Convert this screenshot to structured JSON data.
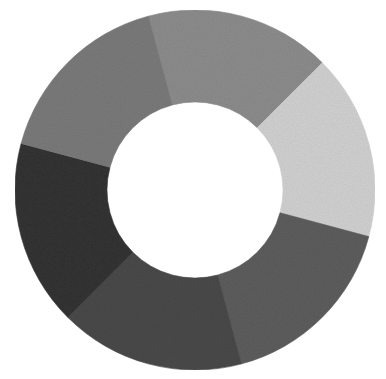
{
  "figure": {
    "center": [
      195,
      190
    ],
    "outer_radius": 180,
    "inner_radius": 88,
    "background": "#ffffff"
  },
  "segments": [
    {
      "name": "segment-top",
      "start_deg": -15,
      "end_deg": 45,
      "color": "#8e8e8e"
    },
    {
      "name": "segment-upper-right",
      "start_deg": 45,
      "end_deg": 105,
      "color": "#d3d3d3"
    },
    {
      "name": "segment-lower-right",
      "start_deg": 105,
      "end_deg": 165,
      "color": "#5f5f5f"
    },
    {
      "name": "segment-bottom",
      "start_deg": 165,
      "end_deg": 225,
      "color": "#4c4c4c"
    },
    {
      "name": "segment-left",
      "start_deg": 225,
      "end_deg": 285,
      "color": "#363636"
    },
    {
      "name": "segment-upper-left",
      "start_deg": 285,
      "end_deg": 345,
      "color": "#7b7b7b"
    }
  ]
}
